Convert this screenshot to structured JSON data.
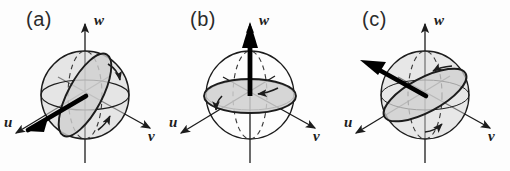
{
  "figure": {
    "type": "scientific-diagram",
    "background_color": "#fdfdfd",
    "shade_color": "#d2d2d2",
    "line_color": "#1c1c1c",
    "bold_color": "#000000"
  },
  "panels": [
    {
      "id": "a",
      "label": "(a)",
      "axes": {
        "u": "u",
        "v": "v",
        "w": "w"
      },
      "vector": {
        "direction": "u",
        "angle_deg": 196,
        "description": "bold arrow along negative u axis"
      },
      "disc": {
        "orientation": "tilted",
        "tilt_deg": -62,
        "description": "shaded ellipse perpendicular to u"
      },
      "circulation_arrows": 2
    },
    {
      "id": "b",
      "label": "(b)",
      "axes": {
        "u": "u",
        "v": "v",
        "w": "w"
      },
      "vector": {
        "direction": "w",
        "angle_deg": 90,
        "description": "bold arrow along positive w axis"
      },
      "disc": {
        "orientation": "equatorial",
        "tilt_deg": 0,
        "description": "shaded horizontal equatorial disc"
      },
      "circulation_arrows": 2
    },
    {
      "id": "c",
      "label": "(c)",
      "axes": {
        "u": "u",
        "v": "v",
        "w": "w"
      },
      "vector": {
        "direction": "u-w",
        "angle_deg": 153,
        "description": "bold arrow between u and w axes"
      },
      "disc": {
        "orientation": "tilted",
        "tilt_deg": -28,
        "description": "shaded ellipse perpendicular to u-w vector"
      },
      "circulation_arrows": 2
    }
  ]
}
